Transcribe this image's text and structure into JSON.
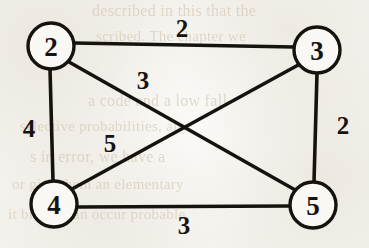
{
  "figure": {
    "kind": "weighted-undirected-graph",
    "background_color": "#f4f2ed",
    "ink_color": "#16130f",
    "node_fill": "#faf8f4",
    "ghost_text_color": "#cdbfa8"
  },
  "nodes": [
    {
      "id": "2",
      "label": "2",
      "cx": 51,
      "cy": 46,
      "r": 23
    },
    {
      "id": "3",
      "label": "3",
      "cx": 317,
      "cy": 50,
      "r": 23
    },
    {
      "id": "4",
      "label": "4",
      "cx": 54,
      "cy": 204,
      "r": 23
    },
    {
      "id": "5",
      "label": "5",
      "cx": 313,
      "cy": 205,
      "r": 23
    }
  ],
  "edges": [
    {
      "id": "edge-2-3",
      "source": "2",
      "target": "3",
      "weight": "2",
      "x1": 74,
      "y1": 43,
      "x2": 294,
      "y2": 47,
      "label_x": 182,
      "label_y": 28
    },
    {
      "id": "edge-2-4",
      "source": "2",
      "target": "4",
      "weight": "4",
      "x1": 50,
      "y1": 69,
      "x2": 53,
      "y2": 181,
      "label_x": 29,
      "label_y": 128
    },
    {
      "id": "edge-3-5",
      "source": "3",
      "target": "5",
      "weight": "2",
      "x1": 317,
      "y1": 73,
      "x2": 314,
      "y2": 182,
      "label_x": 343,
      "label_y": 125
    },
    {
      "id": "edge-4-5",
      "source": "4",
      "target": "5",
      "weight": "3",
      "x1": 77,
      "y1": 207,
      "x2": 290,
      "y2": 206,
      "label_x": 184,
      "label_y": 225
    },
    {
      "id": "edge-2-5",
      "source": "2",
      "target": "5",
      "weight": "3",
      "x1": 69,
      "y1": 62,
      "x2": 297,
      "y2": 191,
      "label_x": 143,
      "label_y": 80
    },
    {
      "id": "edge-4-3",
      "source": "4",
      "target": "3",
      "weight": "5",
      "x1": 72,
      "y1": 189,
      "x2": 300,
      "y2": 64,
      "label_x": 110,
      "label_y": 143
    }
  ],
  "ghost_text": [
    {
      "text": "described in this that the",
      "x": 92,
      "y": 2,
      "size": 16
    },
    {
      "text": "scribed. The chapter we",
      "x": 96,
      "y": 28,
      "size": 15
    },
    {
      "text": "a code and a low fall",
      "x": 88,
      "y": 92,
      "size": 16
    },
    {
      "text": "selective probabilities, any",
      "x": 20,
      "y": 118,
      "size": 15
    },
    {
      "text": "s in error, we have a",
      "x": 30,
      "y": 148,
      "size": 16
    },
    {
      "text": "or give them an elementary",
      "x": 12,
      "y": 176,
      "size": 15
    },
    {
      "text": "it blocks can occur probable",
      "x": 8,
      "y": 206,
      "size": 15
    }
  ]
}
